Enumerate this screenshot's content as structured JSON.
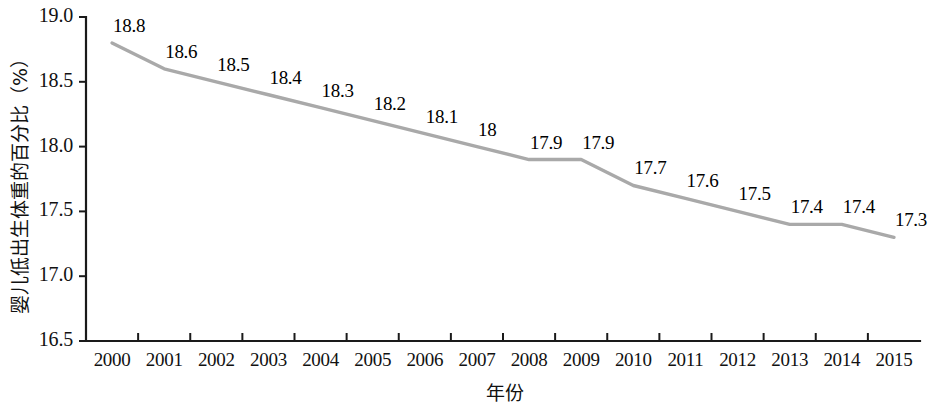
{
  "chart_data": {
    "type": "line",
    "title": "",
    "subtitle": "",
    "xlabel": "年份",
    "ylabel": "婴儿低出生体重的百分比（%）",
    "categories": [
      "2000",
      "2001",
      "2002",
      "2003",
      "2004",
      "2005",
      "2006",
      "2007",
      "2008",
      "2009",
      "2010",
      "2011",
      "2012",
      "2013",
      "2014",
      "2015"
    ],
    "values": [
      18.8,
      18.6,
      18.5,
      18.4,
      18.3,
      18.2,
      18.1,
      18,
      17.9,
      17.9,
      17.7,
      17.6,
      17.5,
      17.4,
      17.4,
      17.3
    ],
    "point_labels": [
      "18.8",
      "18.6",
      "18.5",
      "18.4",
      "18.3",
      "18.2",
      "18.1",
      "18",
      "17.9",
      "17.9",
      "17.7",
      "17.6",
      "17.5",
      "17.4",
      "17.4",
      "17.3"
    ],
    "ylim": [
      16.5,
      19.0
    ],
    "yticks": [
      16.5,
      17.0,
      17.5,
      18.0,
      18.5,
      19.0
    ],
    "ytick_labels": [
      "16.5",
      "17.0",
      "17.5",
      "18.0",
      "18.5",
      "19.0"
    ],
    "grid": false,
    "legend": false,
    "legend_position": "none",
    "series_color": "#a9a9a9",
    "axis_color": "#1a1a1a",
    "text_color": "#111111",
    "background": "#ffffff"
  }
}
